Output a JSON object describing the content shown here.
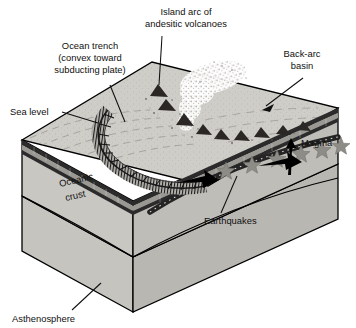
{
  "figure": {
    "background_color": "#ffffff"
  },
  "labels": {
    "island_arc_line1": "Island arc of",
    "island_arc_line2": "andesitic volcanoes",
    "ocean_trench_line1": "Ocean trench",
    "ocean_trench_line2": "(convex toward",
    "ocean_trench_line3": "subducting plate)",
    "back_arc_line1": "Back-arc",
    "back_arc_line2": "basin",
    "sea_level": "Sea level",
    "magma": "Magma",
    "oceanic_crust_line1": "Oceanic",
    "oceanic_crust_line2": "crust",
    "earthquakes": "Earthquakes",
    "asthenosphere": "Asthenosphere"
  },
  "colors": {
    "outline": "#000000",
    "text": "#101010",
    "top_surface": "#cfcdc8",
    "left_face": "#c9c7c2",
    "right_face": "#bfbdb8",
    "asthenosphere_left": "#c6c4bf",
    "asthenosphere_right": "#b9b7b2",
    "crust_band_dark": "#2b2b2b",
    "crust_band_light": "#9a9893",
    "volcano": "#2a2724",
    "ash_plume": "#e8e6e1",
    "earthquake_star": "#8e8c86",
    "slab": "#242424",
    "arrow": "#000000"
  },
  "features": {
    "volcano_count": 9,
    "earthquake_star_count": 6,
    "convergence_arrow_count": 2,
    "magma_arrow_count": 1
  }
}
